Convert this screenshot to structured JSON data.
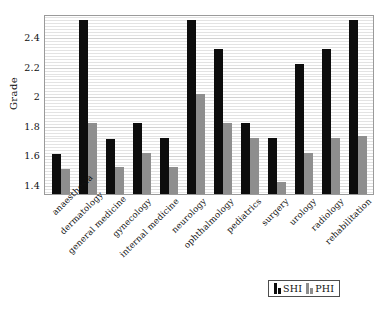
{
  "chart_data": {
    "type": "bar",
    "title": "",
    "subtitle": "",
    "xlabel": "",
    "ylabel": "Grade",
    "ylim": [
      1.33,
      2.55
    ],
    "yticks": [
      1.4,
      1.6,
      1.8,
      2,
      2.2,
      2.4
    ],
    "ytick_labels": [
      "1.4",
      "1.6",
      "1.8",
      "2",
      "2.2",
      "2.4"
    ],
    "grid": true,
    "grid_axis": "y",
    "legend_position": "bottom-right",
    "categories": [
      "anaesthesia",
      "dermatology",
      "general medicine",
      "gynecology",
      "internal medicine",
      "neurology",
      "ophthalmology",
      "pediatrics",
      "surgery",
      "urology",
      "radiology",
      "rehabilitation"
    ],
    "series": [
      {
        "name": "SHI",
        "color": "#0d0d0d",
        "values": [
          1.6,
          2.51,
          1.7,
          1.81,
          1.71,
          2.51,
          2.31,
          1.81,
          1.71,
          2.21,
          2.31,
          2.51
        ]
      },
      {
        "name": "PHI",
        "color": "#8e8e8e",
        "values": [
          1.5,
          1.81,
          1.51,
          1.61,
          1.51,
          2.01,
          1.81,
          1.71,
          1.41,
          1.61,
          1.71,
          1.72
        ]
      }
    ]
  },
  "legend": {
    "items": [
      {
        "label": "SHI",
        "color": "#0d0d0d"
      },
      {
        "label": "PHI",
        "color": "#8e8e8e"
      }
    ]
  }
}
